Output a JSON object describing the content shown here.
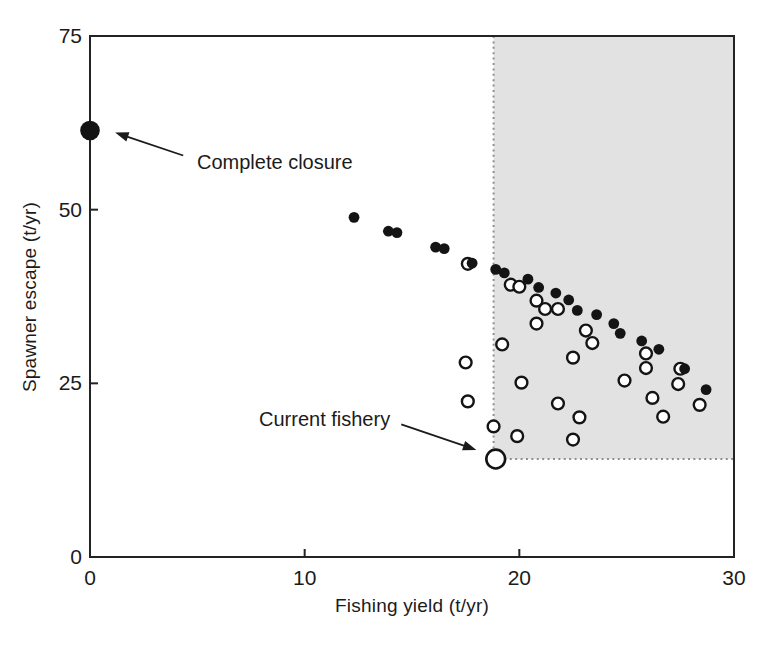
{
  "figure": {
    "background": "#ffffff",
    "style": {
      "point_color": "#141414",
      "frame_color": "#232323",
      "text_color": "#1b1b1b",
      "dotted_color": "#8f8f8f"
    }
  },
  "chart_data": {
    "type": "scatter",
    "title": "",
    "xlabel": "Fishing yield (t/yr)",
    "ylabel": "Spawner escape (t/yr)",
    "xlim": [
      0,
      30
    ],
    "ylim": [
      0,
      75
    ],
    "x_ticks": [
      0,
      10,
      20,
      30
    ],
    "y_ticks": [
      0,
      25,
      50,
      75
    ],
    "grid": false,
    "legend": "none",
    "shaded_region": {
      "x_range": [
        18.8,
        30
      ],
      "y_range": [
        14.1,
        75
      ],
      "fill": "#e2e2e2",
      "border_style": "dotted"
    },
    "series": [
      {
        "name": "open-circles (spawner escape outcomes under fishing scenarios)",
        "marker": "open-circle",
        "fill": "#ffffff",
        "stroke": "#141414",
        "points": [
          [
            17.6,
            42.2
          ],
          [
            19.6,
            39.2
          ],
          [
            20.0,
            38.9
          ],
          [
            20.8,
            36.9
          ],
          [
            21.2,
            35.7
          ],
          [
            21.8,
            35.7
          ],
          [
            20.8,
            33.6
          ],
          [
            19.2,
            30.6
          ],
          [
            23.1,
            32.6
          ],
          [
            23.4,
            30.8
          ],
          [
            17.5,
            28.0
          ],
          [
            22.5,
            28.7
          ],
          [
            25.9,
            29.3
          ],
          [
            25.9,
            27.2
          ],
          [
            27.5,
            27.1
          ],
          [
            20.1,
            25.1
          ],
          [
            24.9,
            25.4
          ],
          [
            27.4,
            24.9
          ],
          [
            17.6,
            22.4
          ],
          [
            21.8,
            22.1
          ],
          [
            26.2,
            22.9
          ],
          [
            28.4,
            21.9
          ],
          [
            22.8,
            20.1
          ],
          [
            26.7,
            20.2
          ],
          [
            18.8,
            18.8
          ],
          [
            19.9,
            17.4
          ],
          [
            22.5,
            16.9
          ]
        ]
      },
      {
        "name": "filled-circles (yield vs escapement trade-off frontier)",
        "marker": "filled-circle",
        "fill": "#141414",
        "points": [
          [
            12.3,
            48.9
          ],
          [
            13.9,
            46.9
          ],
          [
            14.3,
            46.7
          ],
          [
            16.1,
            44.6
          ],
          [
            16.5,
            44.4
          ],
          [
            17.8,
            42.3
          ],
          [
            18.9,
            41.4
          ],
          [
            19.3,
            40.9
          ],
          [
            20.4,
            40.0
          ],
          [
            20.9,
            38.8
          ],
          [
            21.7,
            38.0
          ],
          [
            22.3,
            37.0
          ],
          [
            22.7,
            35.5
          ],
          [
            23.6,
            34.9
          ],
          [
            24.4,
            33.6
          ],
          [
            24.7,
            32.2
          ],
          [
            25.7,
            31.1
          ],
          [
            26.5,
            29.9
          ],
          [
            27.7,
            27.1
          ],
          [
            28.7,
            24.1
          ]
        ]
      }
    ],
    "special_points": [
      {
        "name": "complete-closure-point",
        "marker": "large-filled-circle",
        "x": 0,
        "y": 61.4,
        "annotation": "complete_closure"
      },
      {
        "name": "current-fishery-point",
        "marker": "large-open-circle",
        "x": 18.9,
        "y": 14.1,
        "annotation": "current_fishery"
      }
    ],
    "annotations": {
      "complete_closure": {
        "label": "Complete closure",
        "arrow_tail": [
          4.34,
          57.8
        ],
        "arrow_head": [
          1.17,
          61.1
        ]
      },
      "current_fishery": {
        "label": "Current fishery",
        "arrow_tail": [
          14.5,
          19.1
        ],
        "arrow_head": [
          18.0,
          15.4
        ]
      }
    }
  }
}
